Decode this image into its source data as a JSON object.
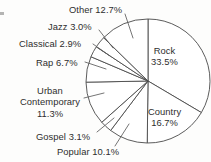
{
  "chart_data": {
    "type": "pie",
    "title": "",
    "subtitle": "",
    "xlabel": "",
    "ylabel": "",
    "legend_position": "none",
    "grid": false,
    "units": "percent",
    "start_angle_deg": 0,
    "direction": "clockwise",
    "categories": [
      "Rock",
      "Country",
      "Popular",
      "Gospel",
      "Urban Contemporary",
      "Rap",
      "Classical",
      "Jazz",
      "Other"
    ],
    "values": [
      33.5,
      16.7,
      10.1,
      3.1,
      11.3,
      6.7,
      2.9,
      3.0,
      12.7
    ],
    "slices": [
      {
        "name": "Rock",
        "label": "Rock",
        "value_text": "33.5%",
        "value": 33.5,
        "label_placement": "inside",
        "label_lines": [
          "Rock",
          "33.5%"
        ],
        "left": 151,
        "top": 45,
        "leader": null
      },
      {
        "name": "Country",
        "label": "Country",
        "value_text": "16.7%",
        "value": 16.7,
        "label_placement": "inside",
        "label_lines": [
          "Country",
          "16.7%"
        ],
        "left": 148,
        "top": 106,
        "leader": null
      },
      {
        "name": "Popular",
        "label": "Popular",
        "value_text": "10.1%",
        "value": 10.1,
        "label_placement": "outside",
        "label_lines": [
          "Popular 10.1%"
        ],
        "left": 57,
        "top": 146,
        "leader": {
          "x1": 115,
          "y1": 146,
          "x2": 129,
          "y2": 124
        }
      },
      {
        "name": "Gospel",
        "label": "Gospel",
        "value_text": "3.1%",
        "value": 3.1,
        "label_placement": "outside",
        "label_lines": [
          "Gospel 3.1%"
        ],
        "left": 36,
        "top": 131,
        "leader": {
          "x1": 97,
          "y1": 132,
          "x2": 114,
          "y2": 118
        }
      },
      {
        "name": "Urban Contemporary",
        "label": "Urban Contemporary",
        "value_text": "11.3%",
        "value": 11.3,
        "label_placement": "outside",
        "label_lines": [
          "Urban",
          "Contemporary",
          "11.3%"
        ],
        "left": 20,
        "top": 85,
        "leader": {
          "x1": 84,
          "y1": 98,
          "x2": 104,
          "y2": 93
        }
      },
      {
        "name": "Rap",
        "label": "Rap",
        "value_text": "6.7%",
        "value": 6.7,
        "label_placement": "outside",
        "label_lines": [
          "Rap 6.7%"
        ],
        "left": 36,
        "top": 57,
        "leader": {
          "x1": 85,
          "y1": 62,
          "x2": 106,
          "y2": 69
        }
      },
      {
        "name": "Classical",
        "label": "Classical",
        "value_text": "2.9%",
        "value": 2.9,
        "label_placement": "outside",
        "label_lines": [
          "Classical 2.9%"
        ],
        "left": 19,
        "top": 38,
        "leader": {
          "x1": 93,
          "y1": 44,
          "x2": 110,
          "y2": 56
        }
      },
      {
        "name": "Jazz",
        "label": "Jazz",
        "value_text": "3.0%",
        "value": 3.0,
        "label_placement": "outside",
        "label_lines": [
          "Jazz 3.0%"
        ],
        "left": 48,
        "top": 21,
        "leader": {
          "x1": 99,
          "y1": 30,
          "x2": 113,
          "y2": 48
        }
      },
      {
        "name": "Other",
        "label": "Other",
        "value_text": "12.7%",
        "value": 12.7,
        "label_placement": "outside",
        "label_lines": [
          "Other 12.7%"
        ],
        "left": 69,
        "top": 4,
        "leader": {
          "x1": 125,
          "y1": 14,
          "x2": 133,
          "y2": 38
        }
      }
    ],
    "geometry": {
      "center_x": 148,
      "center_y": 81,
      "radius": 62
    },
    "colors": {
      "slice_fill": "#ffffff",
      "slice_stroke": "#4a4a4a",
      "text": "#2e2e2e",
      "background": "#fdfdfc"
    }
  }
}
